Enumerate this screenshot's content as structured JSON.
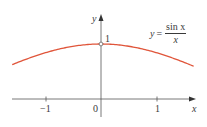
{
  "chart_data": {
    "type": "line",
    "title": "",
    "xlabel": "x",
    "ylabel": "y",
    "function": "y = sin(x)/x",
    "annotation": {
      "lhs": "y",
      "eq": "=",
      "numerator": "sin x",
      "denominator": "x"
    },
    "x_ticks": [
      {
        "value": -1,
        "label": "−1"
      },
      {
        "value": 0,
        "label": "0"
      },
      {
        "value": 1,
        "label": "1"
      }
    ],
    "y_ticks": [
      {
        "value": 1,
        "label": "1"
      }
    ],
    "xlim": [
      -1.6,
      1.67
    ],
    "ylim": [
      0,
      1.1
    ],
    "open_point": {
      "x": 0,
      "y": 1
    },
    "series": [
      {
        "name": "sin x / x",
        "color": "#e0553a",
        "x": [
          -1.6,
          -1.4,
          -1.2,
          -1.0,
          -0.8,
          -0.6,
          -0.4,
          -0.2,
          0,
          0.2,
          0.4,
          0.6,
          0.8,
          1.0,
          1.2,
          1.4,
          1.67
        ],
        "y": [
          0.625,
          0.704,
          0.777,
          0.841,
          0.897,
          0.941,
          0.974,
          0.993,
          1.0,
          0.993,
          0.974,
          0.941,
          0.897,
          0.841,
          0.777,
          0.704,
          0.596
        ]
      }
    ],
    "grid": false,
    "legend": "none"
  },
  "labels": {
    "x_axis": "x",
    "y_axis": "y",
    "y_tick_1": "1",
    "x_tick_neg1": "−1",
    "x_tick_0": "0",
    "x_tick_1": "1"
  }
}
